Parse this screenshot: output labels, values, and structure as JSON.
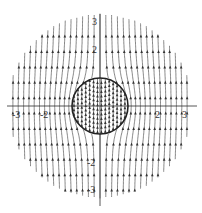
{
  "figure": {
    "x_ticks": [
      {
        "value": -3,
        "label": "-3"
      },
      {
        "value": -2,
        "label": "-2"
      },
      {
        "value": 2,
        "label": "2"
      },
      {
        "value": 3,
        "label": "3"
      }
    ],
    "y_ticks": [
      {
        "value": 3,
        "label": "3"
      },
      {
        "value": 2,
        "label": "2"
      },
      {
        "value": -2,
        "label": "-2"
      },
      {
        "value": -3,
        "label": "-3"
      }
    ],
    "sphere_radius": 1,
    "outer_radius": 3.3,
    "field_direction": "up",
    "colors": {
      "lines": "#555555",
      "arrows": "#333333",
      "axes": "#444444",
      "circle": "#222222"
    }
  }
}
